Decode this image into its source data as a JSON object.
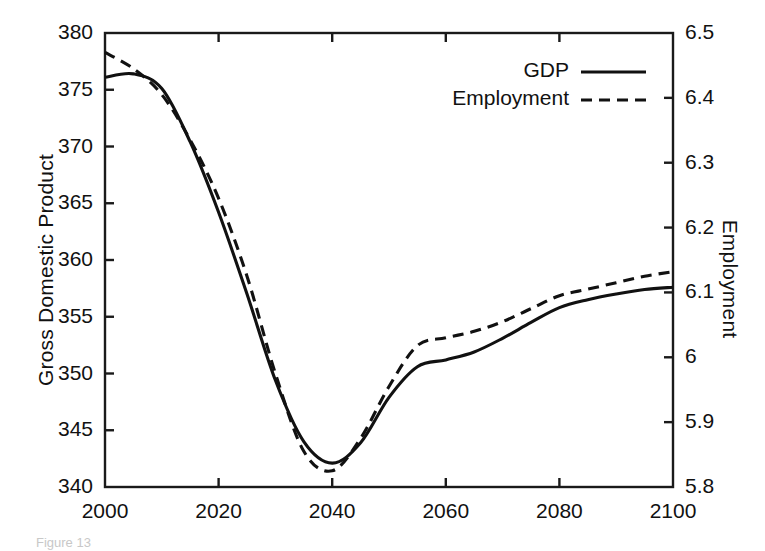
{
  "chart_data": {
    "type": "line",
    "title": "",
    "xlabel": "",
    "ylabel": "Gross Domestic Product",
    "y2label": "Employment",
    "xlim": [
      2000,
      2100
    ],
    "ylim": [
      340,
      380
    ],
    "y2lim": [
      5.8,
      6.5
    ],
    "grid": false,
    "legend_position": "top-right",
    "x_ticks": [
      "2000",
      "2020",
      "2040",
      "2060",
      "2080",
      "2100"
    ],
    "x_tick_values": [
      2000,
      2020,
      2040,
      2060,
      2080,
      2100
    ],
    "y_ticks": [
      "340",
      "345",
      "350",
      "355",
      "360",
      "365",
      "370",
      "375",
      "380"
    ],
    "y_tick_values": [
      340,
      345,
      350,
      355,
      360,
      365,
      370,
      375,
      380
    ],
    "y2_ticks": [
      "5.8",
      "5.9",
      "6",
      "6.1",
      "6.2",
      "6.3",
      "6.4",
      "6.5"
    ],
    "y2_tick_values": [
      5.8,
      5.9,
      6.0,
      6.1,
      6.2,
      6.3,
      6.4,
      6.5
    ],
    "x": [
      2000,
      2005,
      2010,
      2015,
      2020,
      2025,
      2030,
      2035,
      2040,
      2045,
      2050,
      2055,
      2060,
      2065,
      2070,
      2075,
      2080,
      2085,
      2090,
      2095,
      2100
    ],
    "series": [
      {
        "name": "GDP",
        "axis": "left",
        "style": "solid",
        "color": "#111111",
        "values": [
          376.1,
          376.4,
          375.1,
          370.4,
          364.2,
          357.0,
          349.4,
          344.0,
          342.1,
          343.9,
          347.9,
          350.6,
          351.2,
          351.9,
          353.1,
          354.5,
          355.8,
          356.5,
          357.0,
          357.4,
          357.6
        ]
      },
      {
        "name": "Employment",
        "axis": "right",
        "style": "dashed",
        "color": "#111111",
        "values": [
          6.47,
          6.445,
          6.405,
          6.335,
          6.245,
          6.125,
          5.975,
          5.855,
          5.825,
          5.875,
          5.955,
          6.018,
          6.03,
          6.04,
          6.055,
          6.075,
          6.095,
          6.105,
          6.115,
          6.125,
          6.132
        ]
      }
    ]
  },
  "legend": {
    "items": [
      {
        "label": "GDP",
        "style": "solid"
      },
      {
        "label": "Employment",
        "style": "dashed"
      }
    ]
  },
  "axes": {
    "left_title": "Gross Domestic Product",
    "right_title": "Employment"
  },
  "caption": {
    "ghost_text": "Figure 13"
  }
}
